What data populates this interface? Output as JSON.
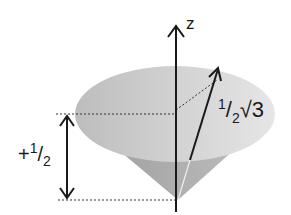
{
  "diagram": {
    "axis_label": "z",
    "magnitude_label": {
      "num": "1",
      "den": "2",
      "root": "√3"
    },
    "projection_label": {
      "sign": "+",
      "num": "1",
      "den": "2"
    },
    "colors": {
      "cone_top": "#c8c8c8",
      "cone_side": "#a5a5a5",
      "line": "#1a1a1a"
    }
  }
}
